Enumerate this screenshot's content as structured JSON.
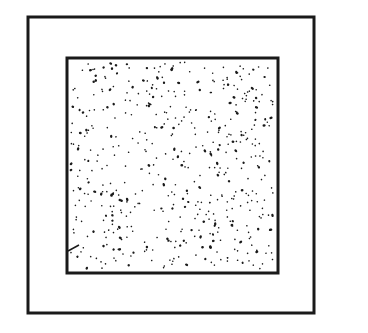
{
  "diagram": {
    "background": "#ffffff",
    "stroke_color": "#1a1a1a",
    "outer_square": {
      "x": 28,
      "y": 17,
      "width": 286,
      "height": 296,
      "stroke_width": 3
    },
    "inner_square": {
      "x": 67,
      "y": 58,
      "width": 211,
      "height": 215,
      "stroke_width": 3,
      "fill": "stippled"
    },
    "stipple": {
      "dot_count": 520,
      "dot_color": "#1a1a1a",
      "seed": 7
    },
    "tick_mark": {
      "x1": 68,
      "y1": 251,
      "x2": 79,
      "y2": 245
    }
  }
}
